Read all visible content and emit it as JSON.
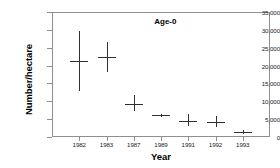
{
  "chart_data": {
    "type": "scatter",
    "title": "Age-0",
    "xlabel": "Year",
    "ylabel": "Number/hectare",
    "grid": false,
    "legend": null,
    "ylim": [
      0,
      35000
    ],
    "ytick_labels": [
      "35,000",
      "30,000",
      "25,000",
      "20,000",
      "15,000",
      "10,000",
      "5,000",
      "0"
    ],
    "ytick_values": [
      35000,
      30000,
      25000,
      20000,
      15000,
      10000,
      5000,
      0
    ],
    "categories": [
      "1982",
      "1983",
      "1987",
      "1989",
      "1991",
      "1992",
      "1993"
    ],
    "x": [
      1982,
      1983,
      1987,
      1989,
      1991,
      1992,
      1993
    ],
    "values": [
      21200,
      22400,
      9200,
      6100,
      4500,
      4200,
      1400
    ],
    "error_low": [
      12800,
      18300,
      7400,
      5700,
      3000,
      2900,
      900
    ],
    "error_high": [
      29800,
      26500,
      11700,
      6500,
      6400,
      6000,
      2000
    ],
    "series": [
      {
        "name": "Age-0",
        "points": [
          {
            "year": "1982",
            "mean": 21200,
            "low": 12800,
            "high": 29800
          },
          {
            "year": "1983",
            "mean": 22400,
            "low": 18300,
            "high": 26500
          },
          {
            "year": "1987",
            "mean": 9200,
            "low": 7400,
            "high": 11700
          },
          {
            "year": "1989",
            "mean": 6100,
            "low": 5700,
            "high": 6500
          },
          {
            "year": "1991",
            "mean": 4500,
            "low": 3000,
            "high": 6400
          },
          {
            "year": "1992",
            "mean": 4200,
            "low": 2900,
            "high": 6000
          },
          {
            "year": "1993",
            "mean": 1400,
            "low": 900,
            "high": 2000
          }
        ]
      }
    ],
    "marker_color": "#303030",
    "axis_color": "#8f8f8f"
  }
}
